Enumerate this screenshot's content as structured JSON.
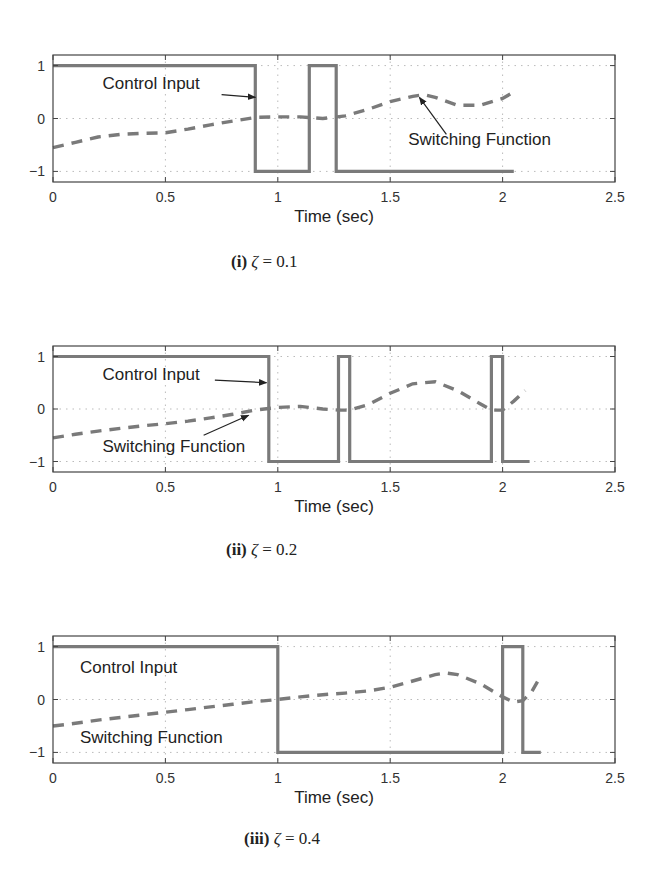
{
  "chart_data": [
    {
      "type": "line",
      "id": "i",
      "caption_label": "(i)",
      "caption_symbol": "ζ",
      "caption_value": "= 0.1",
      "xlabel": "Time (sec)",
      "ylabel": "",
      "xlim": [
        0,
        2.5
      ],
      "ylim": [
        -1.2,
        1.2
      ],
      "xticks": [
        "0",
        "0.5",
        "1",
        "1.5",
        "2",
        "2.5"
      ],
      "yticks": [
        "1",
        "0",
        "−1"
      ],
      "grid": true,
      "series": [
        {
          "name": "Control Input",
          "style": "solid",
          "x": [
            0,
            0.9,
            0.9,
            1.14,
            1.14,
            1.26,
            1.26,
            2.05
          ],
          "y": [
            1,
            1,
            -1,
            -1,
            1,
            1,
            -1,
            -1
          ]
        },
        {
          "name": "Switching Function",
          "style": "dashed",
          "x": [
            0,
            0.1,
            0.2,
            0.3,
            0.4,
            0.5,
            0.6,
            0.7,
            0.8,
            0.9,
            1.0,
            1.1,
            1.2,
            1.3,
            1.4,
            1.5,
            1.6,
            1.65,
            1.7,
            1.8,
            1.9,
            2.0,
            2.05
          ],
          "y": [
            -0.55,
            -0.45,
            -0.35,
            -0.3,
            -0.28,
            -0.27,
            -0.2,
            -0.12,
            -0.05,
            0.02,
            0.03,
            0.03,
            0.0,
            0.05,
            0.17,
            0.32,
            0.42,
            0.45,
            0.4,
            0.25,
            0.25,
            0.38,
            0.5
          ]
        }
      ],
      "annotations": [
        {
          "text": "Control Input",
          "tx": 0.22,
          "ty": 0.55,
          "arrow_from": [
            0.75,
            0.45
          ],
          "arrow_to": [
            0.9,
            0.4
          ]
        },
        {
          "text": "Switching Function",
          "tx": 1.58,
          "ty": -0.5,
          "arrow_from": [
            1.75,
            -0.3
          ],
          "arrow_to": [
            1.63,
            0.4
          ]
        }
      ]
    },
    {
      "type": "line",
      "id": "ii",
      "caption_label": "(ii)",
      "caption_symbol": "ζ",
      "caption_value": "= 0.2",
      "xlabel": "Time (sec)",
      "ylabel": "",
      "xlim": [
        0,
        2.5
      ],
      "ylim": [
        -1.2,
        1.2
      ],
      "xticks": [
        "0",
        "0.5",
        "1",
        "1.5",
        "2",
        "2.5"
      ],
      "yticks": [
        "1",
        "0",
        "−1"
      ],
      "grid": true,
      "series": [
        {
          "name": "Control Input",
          "style": "solid",
          "x": [
            0,
            0.96,
            0.96,
            1.27,
            1.27,
            1.32,
            1.32,
            1.95,
            1.95,
            2.0,
            2.0,
            2.12
          ],
          "y": [
            1,
            1,
            -1,
            -1,
            1,
            1,
            -1,
            -1,
            1,
            1,
            -1,
            -1
          ]
        },
        {
          "name": "Switching Function",
          "style": "dashed",
          "x": [
            0,
            0.1,
            0.2,
            0.3,
            0.4,
            0.5,
            0.6,
            0.7,
            0.8,
            0.9,
            1.0,
            1.1,
            1.2,
            1.27,
            1.32,
            1.4,
            1.5,
            1.6,
            1.7,
            1.8,
            1.9,
            1.95,
            2.0,
            2.05,
            2.1
          ],
          "y": [
            -0.55,
            -0.48,
            -0.42,
            -0.37,
            -0.32,
            -0.28,
            -0.23,
            -0.17,
            -0.1,
            -0.02,
            0.03,
            0.05,
            0.0,
            -0.02,
            -0.02,
            0.08,
            0.3,
            0.48,
            0.52,
            0.35,
            0.1,
            -0.02,
            -0.02,
            0.15,
            0.35
          ]
        }
      ],
      "annotations": [
        {
          "text": "Control Input",
          "tx": 0.22,
          "ty": 0.55,
          "arrow_from": [
            0.72,
            0.55
          ],
          "arrow_to": [
            0.95,
            0.5
          ]
        },
        {
          "text": "Switching Function",
          "tx": 0.22,
          "ty": -0.82,
          "arrow_from": [
            0.67,
            -0.5
          ],
          "arrow_to": [
            0.87,
            -0.12
          ]
        }
      ]
    },
    {
      "type": "line",
      "id": "iii",
      "caption_label": "(iii)",
      "caption_symbol": "ζ",
      "caption_value": "= 0.4",
      "xlabel": "Time (sec)",
      "ylabel": "",
      "xlim": [
        0,
        2.5
      ],
      "ylim": [
        -1.2,
        1.2
      ],
      "xticks": [
        "0",
        "0.5",
        "1",
        "1.5",
        "2",
        "2.5"
      ],
      "yticks": [
        "1",
        "0",
        "−1"
      ],
      "grid": true,
      "series": [
        {
          "name": "Control Input",
          "style": "solid",
          "x": [
            0,
            1.0,
            1.0,
            2.0,
            2.0,
            2.09,
            2.09,
            2.17
          ],
          "y": [
            1,
            1,
            -1,
            -1,
            1,
            1,
            -1,
            -1
          ]
        },
        {
          "name": "Switching Function",
          "style": "dashed",
          "x": [
            0,
            0.1,
            0.2,
            0.3,
            0.4,
            0.5,
            0.6,
            0.7,
            0.8,
            0.9,
            1.0,
            1.1,
            1.2,
            1.3,
            1.4,
            1.5,
            1.6,
            1.7,
            1.75,
            1.8,
            1.9,
            2.0,
            2.05,
            2.09,
            2.13,
            2.17
          ],
          "y": [
            -0.5,
            -0.45,
            -0.39,
            -0.34,
            -0.29,
            -0.24,
            -0.19,
            -0.14,
            -0.09,
            -0.04,
            0.0,
            0.05,
            0.09,
            0.12,
            0.16,
            0.23,
            0.35,
            0.47,
            0.5,
            0.47,
            0.3,
            0.05,
            -0.05,
            -0.02,
            0.15,
            0.45
          ]
        }
      ],
      "annotations": [
        {
          "text": "Control Input",
          "tx": 0.12,
          "ty": 0.5,
          "arrow_from": null,
          "arrow_to": null
        },
        {
          "text": "Switching Function",
          "tx": 0.12,
          "ty": -0.82,
          "arrow_from": null,
          "arrow_to": null
        }
      ]
    }
  ]
}
